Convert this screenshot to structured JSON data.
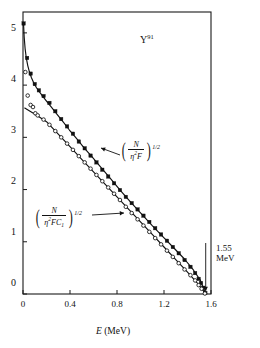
{
  "figure": {
    "isotope_label": "Y",
    "isotope_mass": "91",
    "xtitle_symbol": "E",
    "xtitle_unit": "(MeV)",
    "endpoint_value": "1.55",
    "endpoint_unit": "MeV"
  },
  "formulas": {
    "upper": {
      "numerator": "N",
      "den_eta": "η",
      "den_eta_exp": "2",
      "den_rest": "F",
      "exponent": "1/2"
    },
    "lower": {
      "numerator": "N",
      "den_eta": "η",
      "den_eta_exp": "2",
      "den_rest": "FC",
      "den_sub": "1",
      "exponent": "1/2"
    }
  },
  "chart_data": {
    "type": "scatter",
    "title": "",
    "xlabel": "E (MeV)",
    "ylabel": "",
    "xlim": [
      0,
      1.6
    ],
    "ylim": [
      0,
      5.4
    ],
    "xticks": [
      "0",
      "0.4",
      "0.8",
      "1.2",
      "1.6"
    ],
    "xtickvals": [
      0,
      0.4,
      0.8,
      1.2,
      1.6
    ],
    "yticks": [
      "0",
      "1",
      "2",
      "3",
      "4",
      "5"
    ],
    "ytickvals": [
      0,
      1,
      2,
      3,
      4,
      5
    ],
    "grid": false,
    "legend": "annotated-inline",
    "annotations": [
      {
        "text": "Y91",
        "x": 0.92,
        "y": 5.05
      },
      {
        "text": "1.55 MeV",
        "x": 1.5,
        "y": 1.05
      }
    ],
    "series": [
      {
        "name": "(N/η²F)^(1/2)",
        "marker": "filled-square",
        "points": [
          [
            0.005,
            5.18
          ],
          [
            0.035,
            4.52
          ],
          [
            0.065,
            4.22
          ],
          [
            0.1,
            4.02
          ],
          [
            0.135,
            3.9
          ],
          [
            0.175,
            3.79
          ],
          [
            0.225,
            3.66
          ],
          [
            0.275,
            3.5
          ],
          [
            0.325,
            3.35
          ],
          [
            0.375,
            3.21
          ],
          [
            0.425,
            3.07
          ],
          [
            0.475,
            2.92
          ],
          [
            0.525,
            2.79
          ],
          [
            0.575,
            2.65
          ],
          [
            0.625,
            2.52
          ],
          [
            0.675,
            2.38
          ],
          [
            0.725,
            2.25
          ],
          [
            0.775,
            2.12
          ],
          [
            0.825,
            1.99
          ],
          [
            0.875,
            1.86
          ],
          [
            0.925,
            1.74
          ],
          [
            0.975,
            1.62
          ],
          [
            1.025,
            1.5
          ],
          [
            1.075,
            1.38
          ],
          [
            1.125,
            1.26
          ],
          [
            1.175,
            1.14
          ],
          [
            1.225,
            1.02
          ],
          [
            1.275,
            0.9
          ],
          [
            1.325,
            0.78
          ],
          [
            1.375,
            0.65
          ],
          [
            1.425,
            0.52
          ],
          [
            1.465,
            0.4
          ],
          [
            1.495,
            0.29
          ],
          [
            1.515,
            0.21
          ],
          [
            1.535,
            0.12
          ],
          [
            1.552,
            0.02
          ]
        ]
      },
      {
        "name": "(N/η²FC₁)^(1/2)",
        "marker": "open-circle",
        "points": [
          [
            0.02,
            4.25
          ],
          [
            0.04,
            3.8
          ],
          [
            0.065,
            3.62
          ],
          [
            0.085,
            3.58
          ],
          [
            0.105,
            3.46
          ],
          [
            0.125,
            3.42
          ],
          [
            0.175,
            3.34
          ],
          [
            0.225,
            3.24
          ],
          [
            0.275,
            3.12
          ],
          [
            0.325,
            3.0
          ],
          [
            0.375,
            2.88
          ],
          [
            0.425,
            2.76
          ],
          [
            0.475,
            2.64
          ],
          [
            0.525,
            2.52
          ],
          [
            0.575,
            2.4
          ],
          [
            0.625,
            2.28
          ],
          [
            0.675,
            2.16
          ],
          [
            0.725,
            2.04
          ],
          [
            0.775,
            1.92
          ],
          [
            0.825,
            1.8
          ],
          [
            0.875,
            1.67
          ],
          [
            0.925,
            1.55
          ],
          [
            0.975,
            1.43
          ],
          [
            1.025,
            1.31
          ],
          [
            1.075,
            1.19
          ],
          [
            1.125,
            1.07
          ],
          [
            1.175,
            0.95
          ],
          [
            1.225,
            0.83
          ],
          [
            1.275,
            0.71
          ],
          [
            1.325,
            0.59
          ],
          [
            1.375,
            0.47
          ],
          [
            1.425,
            0.36
          ],
          [
            1.465,
            0.26
          ],
          [
            1.495,
            0.17
          ],
          [
            1.52,
            0.1
          ],
          [
            1.548,
            0.01
          ]
        ]
      }
    ],
    "curves": [
      {
        "name": "upper-fit",
        "points": [
          [
            0.004,
            5.2
          ],
          [
            0.01,
            4.92
          ],
          [
            0.018,
            4.7
          ],
          [
            0.028,
            4.52
          ],
          [
            0.04,
            4.38
          ],
          [
            0.055,
            4.25
          ],
          [
            0.072,
            4.14
          ],
          [
            0.092,
            4.04
          ],
          [
            0.115,
            3.95
          ],
          [
            0.14,
            3.87
          ],
          [
            0.17,
            3.78
          ],
          [
            0.205,
            3.68
          ],
          [
            0.245,
            3.57
          ],
          [
            0.29,
            3.44
          ],
          [
            0.34,
            3.3
          ],
          [
            0.395,
            3.14
          ],
          [
            0.455,
            2.98
          ],
          [
            0.52,
            2.8
          ],
          [
            0.59,
            2.62
          ],
          [
            0.665,
            2.42
          ],
          [
            0.745,
            2.21
          ],
          [
            0.83,
            1.98
          ],
          [
            0.92,
            1.75
          ],
          [
            1.01,
            1.53
          ],
          [
            1.1,
            1.31
          ],
          [
            1.19,
            1.1
          ],
          [
            1.28,
            0.89
          ],
          [
            1.37,
            0.68
          ],
          [
            1.45,
            0.46
          ],
          [
            1.51,
            0.26
          ],
          [
            1.555,
            0.0
          ]
        ]
      },
      {
        "name": "lower-fit",
        "points": [
          [
            0.015,
            3.56
          ],
          [
            0.06,
            3.5
          ],
          [
            0.12,
            3.42
          ],
          [
            0.2,
            3.3
          ],
          [
            0.3,
            3.06
          ],
          [
            0.4,
            2.82
          ],
          [
            0.5,
            2.58
          ],
          [
            0.6,
            2.34
          ],
          [
            0.7,
            2.1
          ],
          [
            0.8,
            1.86
          ],
          [
            0.9,
            1.62
          ],
          [
            1.0,
            1.38
          ],
          [
            1.1,
            1.14
          ],
          [
            1.2,
            0.9
          ],
          [
            1.3,
            0.66
          ],
          [
            1.4,
            0.42
          ],
          [
            1.48,
            0.22
          ],
          [
            1.53,
            0.08
          ],
          [
            1.555,
            0.0
          ]
        ]
      }
    ]
  }
}
